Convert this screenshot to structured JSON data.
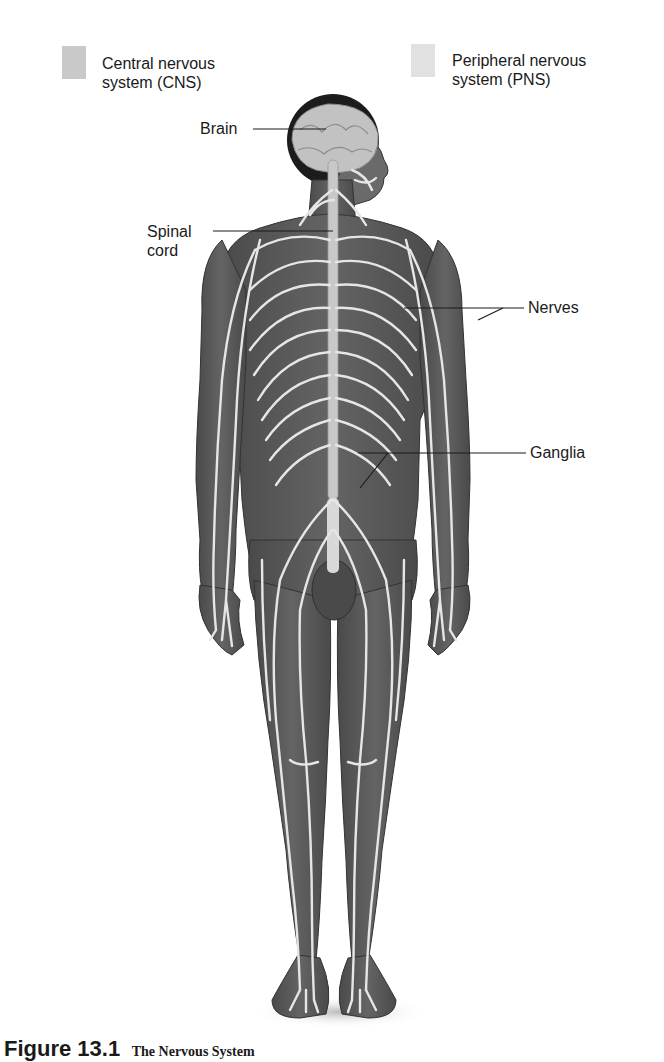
{
  "legend": [
    {
      "id": "cns",
      "label_line1": "Central nervous",
      "label_line2": "system (CNS)",
      "color": "#c8c8c8"
    },
    {
      "id": "pns",
      "label_line1": "Peripheral nervous",
      "label_line2": "system (PNS)",
      "color": "#e0e0e0"
    }
  ],
  "labels": {
    "brain": "Brain",
    "spinal_cord_line1": "Spinal",
    "spinal_cord_line2": "cord",
    "nerves": "Nerves",
    "ganglia": "Ganglia"
  },
  "caption": {
    "number": "Figure 13.1",
    "title": "The Nervous System"
  },
  "colors": {
    "body": "#5e5e5e",
    "body_dark": "#3f3f3f",
    "nerve": "#e6e6e6",
    "brain": "#bdbdbd",
    "hair": "#1c1c1c",
    "leader_line": "#1a1a1a"
  }
}
